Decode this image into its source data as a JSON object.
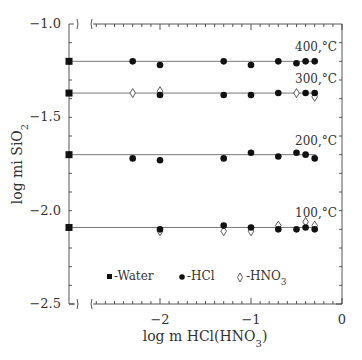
{
  "chart_data": {
    "type": "scatter",
    "title": "",
    "xlabel": "log m HCl(HNO3)",
    "ylabel": "log mi SiO2",
    "xlim": [
      -3,
      0
    ],
    "ylim": [
      -2.5,
      -1.0
    ],
    "x_ticks": [
      "-2",
      "-1",
      "0"
    ],
    "y_ticks": [
      "-1.0",
      "-1.5",
      "-2.0",
      "-2.5"
    ],
    "grid": false,
    "axis_break": "x-axis broken between -3 (water) and ~-2.7",
    "legend": [
      {
        "marker": "square",
        "label": "-Water"
      },
      {
        "marker": "circle",
        "label": "-HCl"
      },
      {
        "marker": "diamond-open",
        "label": "-HNO3"
      }
    ],
    "legend_position": "inside bottom",
    "series": [
      {
        "name": "400,°C",
        "fit_line_y": -1.2,
        "water": [
          {
            "x": -3.0,
            "y": -1.2
          }
        ],
        "HCl": [
          {
            "x": -2.3,
            "y": -1.2
          },
          {
            "x": -2.0,
            "y": -1.22
          },
          {
            "x": -1.3,
            "y": -1.2
          },
          {
            "x": -1.0,
            "y": -1.22
          },
          {
            "x": -0.7,
            "y": -1.2
          },
          {
            "x": -0.5,
            "y": -1.21
          },
          {
            "x": -0.4,
            "y": -1.2
          },
          {
            "x": -0.3,
            "y": -1.2
          }
        ],
        "HNO3": []
      },
      {
        "name": "300,°C",
        "fit_line_y": -1.37,
        "water": [
          {
            "x": -3.0,
            "y": -1.37
          }
        ],
        "HCl": [
          {
            "x": -2.0,
            "y": -1.38
          },
          {
            "x": -1.3,
            "y": -1.38
          },
          {
            "x": -1.0,
            "y": -1.38
          },
          {
            "x": -0.7,
            "y": -1.37
          },
          {
            "x": -0.4,
            "y": -1.37
          },
          {
            "x": -0.3,
            "y": -1.37
          }
        ],
        "HNO3": [
          {
            "x": -2.3,
            "y": -1.37
          },
          {
            "x": -2.0,
            "y": -1.36
          },
          {
            "x": -0.5,
            "y": -1.37
          },
          {
            "x": -0.3,
            "y": -1.39
          }
        ]
      },
      {
        "name": "200,°C",
        "fit_line_y": -1.7,
        "water": [
          {
            "x": -3.0,
            "y": -1.7
          }
        ],
        "HCl": [
          {
            "x": -2.3,
            "y": -1.72
          },
          {
            "x": -2.0,
            "y": -1.73
          },
          {
            "x": -1.3,
            "y": -1.72
          },
          {
            "x": -1.0,
            "y": -1.69
          },
          {
            "x": -0.7,
            "y": -1.71
          },
          {
            "x": -0.5,
            "y": -1.69
          },
          {
            "x": -0.4,
            "y": -1.7
          },
          {
            "x": -0.3,
            "y": -1.72
          }
        ],
        "HNO3": []
      },
      {
        "name": "100,°C",
        "fit_line_y": -2.09,
        "water": [
          {
            "x": -3.0,
            "y": -2.09
          }
        ],
        "HCl": [
          {
            "x": -2.0,
            "y": -2.1
          },
          {
            "x": -1.3,
            "y": -2.08
          },
          {
            "x": -1.0,
            "y": -2.09
          },
          {
            "x": -0.7,
            "y": -2.1
          },
          {
            "x": -0.5,
            "y": -2.1
          },
          {
            "x": -0.4,
            "y": -2.09
          },
          {
            "x": -0.3,
            "y": -2.1
          }
        ],
        "HNO3": [
          {
            "x": -2.0,
            "y": -2.11
          },
          {
            "x": -1.3,
            "y": -2.11
          },
          {
            "x": -1.0,
            "y": -2.11
          },
          {
            "x": -0.7,
            "y": -2.08
          },
          {
            "x": -0.4,
            "y": -2.06
          },
          {
            "x": -0.3,
            "y": -2.08
          }
        ]
      }
    ]
  },
  "labels": {
    "y_title_prefix": "log  mi  SiO",
    "y_title_sub": "2",
    "x_title_prefix": "log  m  HCl(HNO",
    "x_title_sub": "3",
    "x_title_suffix": ")",
    "legend_water": "-Water",
    "legend_hcl": "-HCl",
    "legend_hno3_prefix": "-HNO",
    "legend_hno3_sub": "3"
  }
}
